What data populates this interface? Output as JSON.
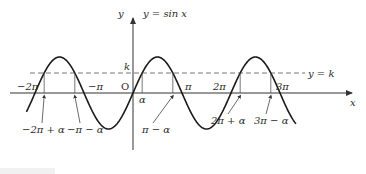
{
  "figure": {
    "curve_label": "y = sin x",
    "line_label": "y = k",
    "axis": {
      "x_label": "x",
      "y_label": "y",
      "origin_label": "O",
      "k_label": "k"
    },
    "tick_labels": [
      {
        "id": "neg2pi",
        "text": "−2π",
        "xv": -2
      },
      {
        "id": "negpi",
        "text": "−π",
        "xv": -1
      },
      {
        "id": "pi",
        "text": "π",
        "xv": 1
      },
      {
        "id": "twopi",
        "text": "2π",
        "xv": 2
      },
      {
        "id": "threepi",
        "text": "3π",
        "xv": 3
      }
    ],
    "alpha_label": "α",
    "solution_labels": [
      {
        "id": "s1",
        "text": "−2π + α"
      },
      {
        "id": "s2",
        "text": "−π − α"
      },
      {
        "id": "s3",
        "text": "π − α"
      },
      {
        "id": "s4",
        "text": "2π + α"
      },
      {
        "id": "s5",
        "text": "3π − α"
      }
    ]
  },
  "colors": {
    "curve": "#1a1a1a",
    "axis": "#333333",
    "dashed": "#777777",
    "text": "#2a2a2a"
  },
  "chart_data": {
    "type": "line",
    "series": [
      {
        "name": "y = sin x",
        "function": "sin(x)",
        "x_range": [
          -7.0,
          10.3
        ]
      },
      {
        "name": "y = k",
        "function": "k (constant, about 0.55)",
        "style": "dashed"
      }
    ],
    "xlabel": "x",
    "ylabel": "y",
    "x_ticks": [
      "−2π",
      "−π",
      "O",
      "π",
      "2π",
      "3π"
    ],
    "annotations": [
      "k",
      "α",
      "−2π + α",
      "−π − α",
      "π − α",
      "2π + α",
      "3π − α"
    ],
    "grid": false
  }
}
